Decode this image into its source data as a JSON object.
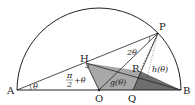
{
  "diagram": {
    "points": {
      "A": "A",
      "B": "B",
      "O": "O",
      "P": "P",
      "H": "H",
      "Q": "Q",
      "R": "R"
    },
    "angles": {
      "theta": "θ",
      "two_theta": "2θ",
      "pi_half_plus_theta_num": "π",
      "pi_half_plus_theta_den": "2",
      "pi_half_plus_theta_tail": "+θ"
    },
    "functions": {
      "g": "g(θ)",
      "h": "h(θ)"
    },
    "colors": {
      "stroke": "#222222",
      "shade_light": "#a8a8a8",
      "shade_dark": "#6e6e6e"
    }
  }
}
